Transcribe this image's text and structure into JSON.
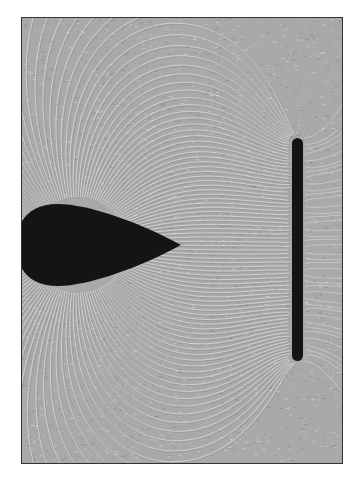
{
  "figure": {
    "background_color": "#a9a9a9",
    "line_color": "#e4e4e4",
    "dark_line_color": "#7d7d7d",
    "object_color": "#141414",
    "frame_color": "#333333"
  },
  "objects": [
    {
      "name": "teardrop-conductor",
      "cx": 36,
      "cy": 227,
      "rx": 42,
      "ry": 41,
      "tip_x": 159
    },
    {
      "name": "vertical-bar-conductor",
      "x": 270,
      "y": 120,
      "width": 11,
      "height": 223
    }
  ]
}
